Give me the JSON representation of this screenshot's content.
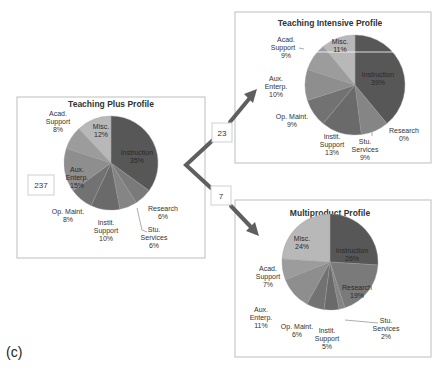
{
  "figure_label": "(c)",
  "source_box": {
    "count": "237"
  },
  "branches": [
    {
      "count": "23",
      "target": "Teaching Intensive Profile"
    },
    {
      "count": "7",
      "target": "Multiproduct Profile"
    }
  ],
  "slice_colors": {
    "Instruction": "#575757",
    "Research": "#7a7a7a",
    "Stu. Services": "#858585",
    "Instit. Support": "#6a6a6a",
    "Op. Maint.": "#727272",
    "Aux. Enterp.": "#8e8e8e",
    "Acad. Support": "#9c9c9c",
    "Misc.": "#b8b8b8"
  },
  "chart_data": [
    {
      "type": "pie",
      "title": "Teaching Plus Profile",
      "categories": [
        "Instruction",
        "Research",
        "Stu. Services",
        "Instit. Support",
        "Op. Maint.",
        "Aux. Enterp.",
        "Acad. Support",
        "Misc."
      ],
      "values": [
        35,
        6,
        6,
        10,
        8,
        15,
        8,
        12
      ],
      "labels": [
        "Instruction 35%",
        "Research 6%",
        "Stu. Services 6%",
        "Instit. Support 10%",
        "Op. Maint. 8%",
        "Aux. Enterp. 15%",
        "Acad. Support 8%",
        "Misc. 12%"
      ],
      "count": "237"
    },
    {
      "type": "pie",
      "title": "Teaching Intensive Profile",
      "categories": [
        "Instruction",
        "Research",
        "Stu. Services",
        "Instit. Support",
        "Op. Maint.",
        "Aux. Enterp.",
        "Acad. Support",
        "Misc."
      ],
      "values": [
        39,
        0,
        9,
        13,
        9,
        10,
        9,
        11
      ],
      "labels": [
        "Instruction 39%",
        "Research 0%",
        "Stu. Services 9%",
        "Instit. Support 13%",
        "Op. Maint. 9%",
        "Aux. Enterp. 10%",
        "Acad. Support 9%",
        "Misc. 11%"
      ],
      "count": "23"
    },
    {
      "type": "pie",
      "title": "Multiproduct Profile",
      "categories": [
        "Instruction",
        "Research",
        "Stu. Services",
        "Instit. Support",
        "Op. Maint.",
        "Aux. Enterp.",
        "Acad. Support",
        "Misc."
      ],
      "values": [
        26,
        19,
        2,
        5,
        6,
        11,
        7,
        24
      ],
      "labels": [
        "Instruction 26%",
        "Research 19%",
        "Stu. Services 2%",
        "Instit. Support 5%",
        "Op. Maint. 6%",
        "Aux. Enterp. 11%",
        "Acad. Support 7%",
        "Misc. 24%"
      ],
      "count": "7"
    }
  ],
  "text": {
    "p1": {
      "title": "Teaching Plus Profile",
      "acad1": "Acad.",
      "acad2": "Support",
      "acad3": "8%",
      "misc1": "Misc.",
      "misc2": "12%",
      "instr1": "Instruction",
      "instr2": "35%",
      "aux1": "Aux.",
      "aux2": "Enterp.",
      "aux3": "15%",
      "op1": "Op. Maint.",
      "op2": "8%",
      "inst1": "Instit.",
      "inst2": "Support",
      "inst3": "10%",
      "res1": "Research",
      "res2": "6%",
      "stu1": "Stu.",
      "stu2": "Services",
      "stu3": "6%"
    },
    "p2": {
      "title": "Teaching Intensive Profile",
      "acad1": "Acad.",
      "acad2": "Support",
      "acad3": "9%",
      "misc1": "Misc.",
      "misc2": "11%",
      "instr1": "Instruction",
      "instr2": "39%",
      "aux1": "Aux.",
      "aux2": "Enterp.",
      "aux3": "10%",
      "op1": "Op. Maint.",
      "op2": "9%",
      "inst1": "Instit.",
      "inst2": "Support",
      "inst3": "13%",
      "res1": "Research",
      "res2": "0%",
      "stu1": "Stu.",
      "stu2": "Services",
      "stu3": "9%"
    },
    "p3": {
      "title": "Multiproduct Profile",
      "acad1": "Acad.",
      "acad2": "Support",
      "acad3": "7%",
      "misc1": "Misc.",
      "misc2": "24%",
      "instr1": "Instruction",
      "instr2": "26%",
      "aux1": "Aux.",
      "aux2": "Enterp.",
      "aux3": "11%",
      "op1": "Op. Maint.",
      "op2": "6%",
      "inst1": "Instit.",
      "inst2": "Support",
      "inst3": "5%",
      "res1": "Research",
      "res2": "19%",
      "stu1": "Stu.",
      "stu2": "Services",
      "stu3": "2%"
    }
  }
}
